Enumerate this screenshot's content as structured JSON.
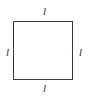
{
  "figure": {
    "type": "geometric-diagram",
    "shape": "square",
    "canvas": {
      "width": 89,
      "height": 100,
      "background_color": "#ffffff"
    },
    "square": {
      "stroke_color": "#3a3a3a",
      "fill_color": "#ffffff",
      "stroke_width": 1.5,
      "left": 13,
      "top": 21,
      "width": 60,
      "height": 59
    },
    "labels": {
      "top": "l",
      "right": "l",
      "bottom": "l",
      "left": "l"
    }
  }
}
